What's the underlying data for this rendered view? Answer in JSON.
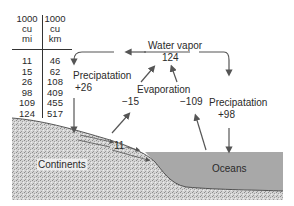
{
  "table": {
    "columns": [
      {
        "header": [
          "1000",
          "cu",
          "mi"
        ],
        "values": [
          "11",
          "15",
          "26",
          "98",
          "109",
          "124"
        ]
      },
      {
        "header": [
          "1000",
          "cu",
          "km"
        ],
        "values": [
          "46",
          "62",
          "108",
          "409",
          "455",
          "517"
        ]
      }
    ]
  },
  "labels": {
    "water_vapor": "Water vapor",
    "water_vapor_value": "124",
    "precip_land": "Precipatation",
    "precip_land_value": "+26",
    "evaporation": "Evaporation",
    "evap_land_value": "−15",
    "evap_ocean_value": "−109",
    "precip_ocean": "Precipatation",
    "precip_ocean_value": "+98",
    "runoff_value": "11",
    "continents": "Continents",
    "oceans": "Oceans"
  },
  "colors": {
    "ocean": "#a8a8a8",
    "land": "#d0d0d0",
    "arrow": "#555555"
  }
}
